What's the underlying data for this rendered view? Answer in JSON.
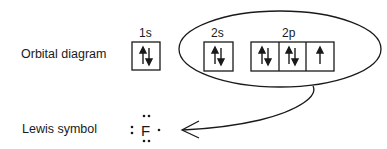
{
  "labels": {
    "orbital_diagram": "Orbital diagram",
    "lewis_symbol": "Lewis symbol"
  },
  "orbitals": {
    "s1": {
      "label": "1s",
      "boxes": [
        "↑↓"
      ]
    },
    "s2": {
      "label": "2s",
      "boxes": [
        "↑↓"
      ]
    },
    "p2": {
      "label": "2p",
      "boxes": [
        "↑↓",
        "↑↓",
        "↑"
      ]
    }
  },
  "lewis": {
    "element": "F",
    "valence_electrons": 7
  },
  "colors": {
    "line": "#1a1a1a",
    "background": "#ffffff"
  }
}
